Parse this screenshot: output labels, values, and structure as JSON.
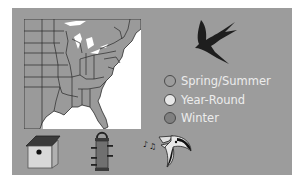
{
  "panel": {
    "background": "#9c9c9c"
  },
  "map": {
    "region": "eastern-united-states",
    "land_color": "#9a9a9a",
    "water_color": "#ffffff",
    "border_color": "#2a2a2a"
  },
  "silhouette": {
    "icon": "swallow-icon",
    "color": "#1e1e1e"
  },
  "legend": {
    "items": [
      {
        "label": "Spring/Summer",
        "color": "#9c9c9c"
      },
      {
        "label": "Year-Round",
        "color": "#e8e8e8"
      },
      {
        "label": "Winter",
        "color": "#808080"
      }
    ]
  },
  "icons": [
    {
      "name": "birdhouse-icon"
    },
    {
      "name": "tube-feeder-icon"
    },
    {
      "name": "singing-bird-icon"
    }
  ]
}
